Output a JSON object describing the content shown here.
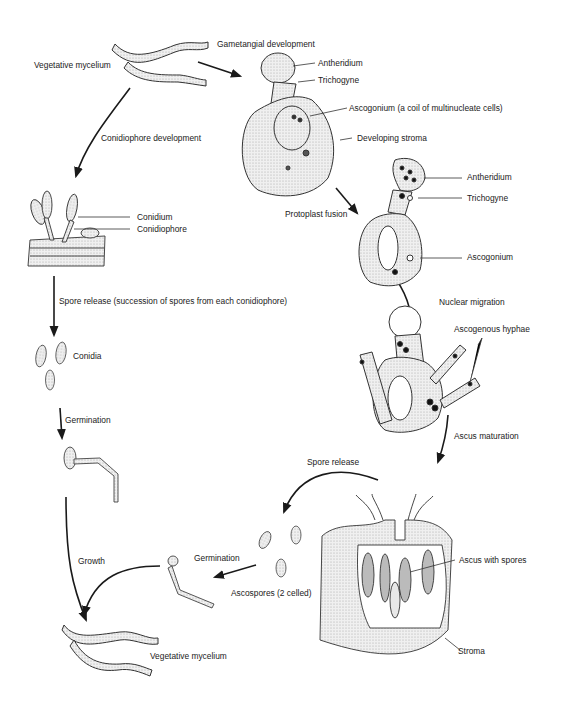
{
  "asexual_cycle": {
    "vegetative_mycelium_top": "Vegetative mycelium",
    "conidiophore_development": "Conidiophore development",
    "conidium": "Conidium",
    "conidiophore": "Conidiophore",
    "spore_release": "Spore release (succession of spores from each conidiophore)",
    "conidia": "Conidia",
    "germination": "Germination",
    "growth": "Growth",
    "vegetative_mycelium_bottom": "Vegetative mycelium"
  },
  "sexual_cycle": {
    "gametangial_development": "Gametangial development",
    "antheridium_1": "Antheridium",
    "trichogyne_1": "Trichogyne",
    "ascogonium_coil": "Ascogonium (a coil of multinucleate cells)",
    "developing_stroma": "Developing stroma",
    "protoplast_fusion": "Protoplast fusion",
    "antheridium_2": "Antheridium",
    "trichogyne_2": "Trichogyne",
    "ascogonium": "Ascogonium",
    "nuclear_migration": "Nuclear migration",
    "ascogenous_hyphae": "Ascogenous hyphae",
    "ascus_maturation": "Ascus maturation",
    "spore_release": "Spore release",
    "ascus_with_spores": "Ascus with spores",
    "stroma": "Stroma",
    "ascospores": "Ascospores (2 celled)",
    "germination": "Germination"
  },
  "colors": {
    "line": "#1a1a1a",
    "cell_fill": "#e6e6e6",
    "nucleus": "#111111"
  }
}
